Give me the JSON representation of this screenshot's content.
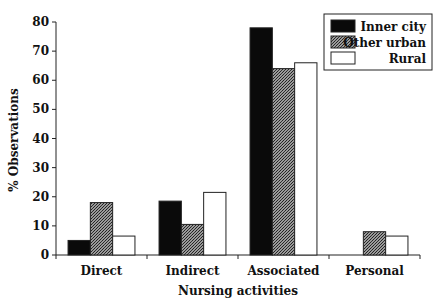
{
  "chart_data": {
    "type": "bar",
    "title": "",
    "xlabel": "Nursing activities",
    "ylabel": "% Observations",
    "ylim": [
      0,
      80
    ],
    "yticks": [
      0,
      10,
      20,
      30,
      40,
      50,
      60,
      70,
      80
    ],
    "grid": false,
    "legend_position": "top-right",
    "categories": [
      "Direct",
      "Indirect",
      "Associated",
      "Personal"
    ],
    "series": [
      {
        "name": "Inner city",
        "fill": "solid-black",
        "color": "#0a0a0a",
        "values": [
          5,
          18.5,
          78,
          0
        ]
      },
      {
        "name": "Other urban",
        "fill": "cross-hatch",
        "color": "#555555",
        "values": [
          18,
          10.5,
          64,
          8
        ]
      },
      {
        "name": "Rural",
        "fill": "white",
        "color": "#ffffff",
        "values": [
          6.5,
          21.5,
          66,
          6.5
        ]
      }
    ]
  }
}
